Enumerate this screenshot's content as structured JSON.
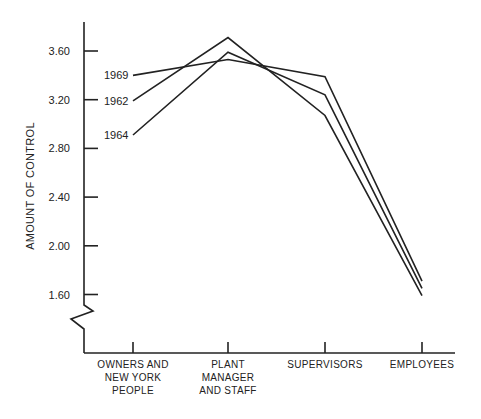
{
  "chart_data": {
    "type": "line",
    "title": "",
    "xlabel": "",
    "ylabel": "AMOUNT OF CONTROL",
    "categories": [
      [
        "OWNERS AND",
        "NEW YORK",
        "PEOPLE"
      ],
      [
        "PLANT",
        "MANAGER",
        "AND STAFF"
      ],
      [
        "SUPERVISORS"
      ],
      [
        "EMPLOYEES"
      ]
    ],
    "category_names": [
      "OWNERS AND NEW YORK PEOPLE",
      "PLANT MANAGER AND STAFF",
      "SUPERVISORS",
      "EMPLOYEES"
    ],
    "yticks": [
      "1.60",
      "2.00",
      "2.40",
      "2.80",
      "3.20",
      "3.60"
    ],
    "ylim": [
      1.6,
      3.6
    ],
    "axis_break": true,
    "grid": false,
    "legend": "inline labels at left of lines",
    "series": [
      {
        "name": "1969",
        "values": [
          3.4,
          3.53,
          3.39,
          1.71
        ]
      },
      {
        "name": "1962",
        "values": [
          3.19,
          3.71,
          3.07,
          1.59
        ]
      },
      {
        "name": "1964",
        "values": [
          2.91,
          3.59,
          3.24,
          1.65
        ]
      }
    ],
    "color": "#222222"
  }
}
